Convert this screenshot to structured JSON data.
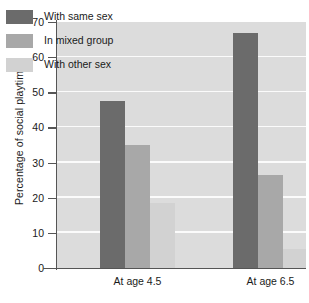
{
  "chart_data": {
    "type": "bar",
    "title": "",
    "xlabel": "",
    "ylabel": "Percentage of social playtime",
    "categories": [
      "At age 4.5",
      "At age 6.5"
    ],
    "series": [
      {
        "name": "With same sex",
        "values": [
          47.5,
          67.0
        ],
        "color": "#6b6b6b"
      },
      {
        "name": "In mixed group",
        "values": [
          35.0,
          26.5
        ],
        "color": "#a8a8a8"
      },
      {
        "name": "With other sex",
        "values": [
          18.5,
          5.5
        ],
        "color": "#d2d2d2"
      }
    ],
    "ylim": [
      0,
      70
    ],
    "yticks": [
      0,
      10,
      20,
      30,
      40,
      50,
      60,
      70
    ],
    "ytick_labels": [
      "0",
      "10",
      "20",
      "30",
      "40",
      "50",
      "60",
      "70"
    ],
    "grid": true,
    "grid_axis": "y",
    "grid_color": "#fbfbfb",
    "plot_background": "#dcdcdc",
    "figure_background": "#ffffff",
    "axis_color": "#555555",
    "legend": {
      "position": "upper-left-inside",
      "entries": [
        {
          "label": "With same sex",
          "color": "#6b6b6b"
        },
        {
          "label": "In mixed group",
          "color": "#a8a8a8"
        },
        {
          "label": "With other sex",
          "color": "#d2d2d2"
        }
      ]
    }
  }
}
